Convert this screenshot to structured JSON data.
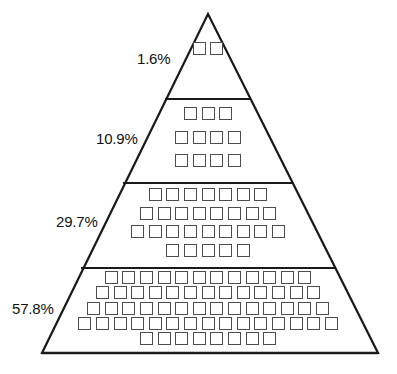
{
  "chart_data": {
    "type": "pie",
    "title": "",
    "subtitle": "",
    "xlabel": "",
    "ylabel": "",
    "legend_position": "left",
    "grid": false,
    "categories": [
      "1.6%",
      "10.9%",
      "29.7%",
      "57.8%"
    ],
    "values": [
      1.6,
      10.9,
      29.7,
      57.8
    ],
    "value_labels": [
      "1.6%",
      "10.9%",
      "29.7%",
      "57.8%"
    ],
    "unit_counts": [
      2,
      11,
      29,
      62
    ],
    "tiers": [
      {
        "index": 0,
        "position": "top",
        "label": "1.6%",
        "value": 1.6,
        "unit_count": 2,
        "rows": [
          2
        ]
      },
      {
        "index": 1,
        "position": "upper-middle",
        "label": "10.9%",
        "value": 10.9,
        "unit_count": 11,
        "rows": [
          3,
          4,
          4
        ]
      },
      {
        "index": 2,
        "position": "lower-middle",
        "label": "29.7%",
        "value": 29.7,
        "unit_count": 29,
        "rows": [
          7,
          8,
          9,
          5
        ]
      },
      {
        "index": 3,
        "position": "bottom",
        "label": "57.8%",
        "value": 57.8,
        "unit_count": 62,
        "rows": [
          12,
          13,
          14,
          15,
          8
        ]
      }
    ],
    "total_percent": "100.0",
    "total_units": 104,
    "colors": {
      "outline": "#1a1a1a",
      "divider": "#1a1a1a",
      "unit_square_border": "#4c4c4c",
      "fill": "#ffffff",
      "label_text": "#111111"
    }
  },
  "figure": {
    "apex": {
      "x": 208,
      "y": 14
    },
    "base_left": {
      "x": 42,
      "y": 353
    },
    "base_right": {
      "x": 378,
      "y": 353
    },
    "divider_y": [
      99,
      183,
      268
    ],
    "labels": [
      {
        "name": "tier-label-1",
        "text": "1.6%",
        "x": 137,
        "y": 50
      },
      {
        "name": "tier-label-2",
        "text": "10.9%",
        "x": 96,
        "y": 130
      },
      {
        "name": "tier-label-3",
        "text": "29.7%",
        "x": 56,
        "y": 213
      },
      {
        "name": "tier-label-4",
        "text": "57.8%",
        "x": 12,
        "y": 300
      }
    ]
  },
  "icons": {
    "unit_square": "unit-square-icon"
  }
}
